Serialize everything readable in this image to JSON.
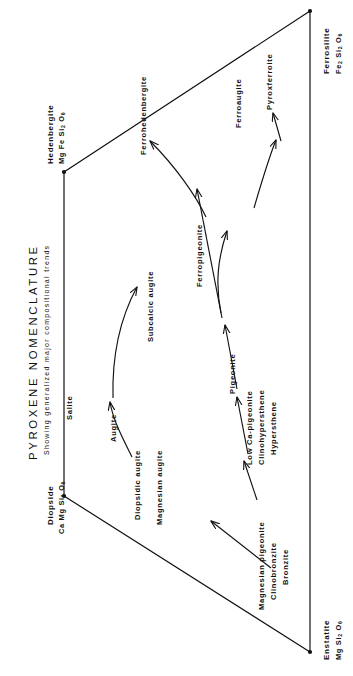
{
  "title": {
    "main": "PYROXENE   NOMENCLATURE",
    "sub": "Showing  generalized  major  compositional  trends"
  },
  "corners": [
    {
      "name": "Hedenbergite",
      "formula_text": "Mg Fe Si2 O6",
      "formula_html": "Mg Fe Si<sub>2</sub> O<sub>6</sub>"
    },
    {
      "name": "Ferrosilite",
      "formula_text": "Fe2 Si2 O6",
      "formula_html": "Fe<sub>2</sub> Si<sub>2</sub> O<sub>6</sub>"
    },
    {
      "name": "Diopside",
      "formula_text": "Ca Mg Si2 O6",
      "formula_html": "Ca Mg Si<sub>2</sub> O<sub>6</sub>"
    },
    {
      "name": "Enstatite",
      "formula_text": "Mg Si2 O6",
      "formula_html": "Mg Si<sub>2</sub> O<sub>6</sub>"
    }
  ],
  "field_labels": [
    {
      "text": "Ferrohedenbergite"
    },
    {
      "text": "Ferroaugite"
    },
    {
      "text": "Pyroxferroite"
    },
    {
      "text": "Ferropigeonite"
    },
    {
      "text": "Subcalcic augite"
    },
    {
      "text": "Pigeonite"
    },
    {
      "text": "Salite"
    },
    {
      "text": "Augite"
    },
    {
      "text": "Low Ca-pigeonite"
    },
    {
      "text": "Clinohypersthene"
    },
    {
      "text": "Hypersthene"
    },
    {
      "text": "Diopsidic augite"
    },
    {
      "text": "Magnesian augite"
    },
    {
      "text": "Magnesian pigeonite"
    },
    {
      "text": "Clinobronzite"
    },
    {
      "text": "Bronzite"
    }
  ],
  "colors": {
    "line": "#111111",
    "background": "#ffffff"
  }
}
